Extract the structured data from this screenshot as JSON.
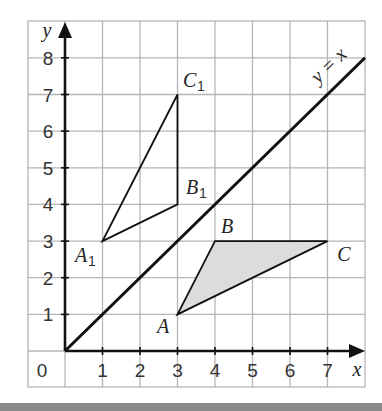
{
  "diagram": {
    "axes": {
      "x_label": "x",
      "y_label": "y",
      "origin_label": "0",
      "x_ticks": [
        "1",
        "2",
        "3",
        "4",
        "5",
        "6",
        "7"
      ],
      "y_ticks": [
        "1",
        "2",
        "3",
        "4",
        "5",
        "6",
        "7",
        "8"
      ],
      "x_range": [
        0,
        7
      ],
      "y_range": [
        0,
        8
      ]
    },
    "line": {
      "label": "y = x",
      "from": [
        0,
        0
      ],
      "to": [
        8,
        8
      ]
    },
    "triangle_ABC": {
      "fill": "#dcdcdc",
      "vertices": [
        {
          "label": "A",
          "x": 3,
          "y": 1
        },
        {
          "label": "B",
          "x": 4,
          "y": 3
        },
        {
          "label": "C",
          "x": 7,
          "y": 3
        }
      ]
    },
    "triangle_A1B1C1": {
      "fill": "none",
      "vertices": [
        {
          "label": "A",
          "sub": "1",
          "x": 1,
          "y": 3
        },
        {
          "label": "B",
          "sub": "1",
          "x": 3,
          "y": 4
        },
        {
          "label": "C",
          "sub": "1",
          "x": 3,
          "y": 7
        }
      ]
    },
    "colors": {
      "grid": "#b5b5b5",
      "axis": "#111111",
      "shade": "#dcdcdc",
      "bar": "#8a8a8a"
    }
  }
}
